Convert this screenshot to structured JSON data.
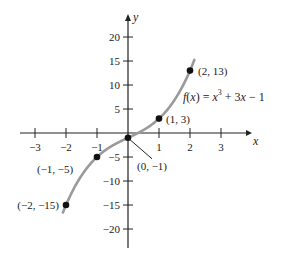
{
  "chart_data": {
    "type": "line",
    "title": "",
    "xlabel": "x",
    "ylabel": "y",
    "xlim": [
      -3.5,
      3.5
    ],
    "ylim": [
      -25,
      23
    ],
    "grid": false,
    "x_ticks": [
      -3,
      -2,
      -1,
      1,
      2,
      3
    ],
    "y_ticks": [
      20,
      15,
      10,
      5,
      -5,
      -10,
      -15,
      -20
    ],
    "function_label": "f(x) = x³ + 3x − 1",
    "series": [
      {
        "name": "f(x) = x^3 + 3x - 1",
        "color": "#9a9a9a",
        "x": [
          -2.1,
          -2,
          -1.5,
          -1,
          -0.5,
          0,
          0.5,
          1,
          1.5,
          2,
          2.15
        ],
        "y": [
          -16.56,
          -15,
          -8.875,
          -5,
          -2.625,
          -1,
          0.625,
          3,
          6.875,
          13,
          15.39
        ]
      }
    ],
    "points": [
      {
        "x": -2,
        "y": -15,
        "label": "(−2, −15)"
      },
      {
        "x": -1,
        "y": -5,
        "label": "(−1, −5)"
      },
      {
        "x": 0,
        "y": -1,
        "label": "(0, −1)"
      },
      {
        "x": 1,
        "y": 3,
        "label": "(1, 3)"
      },
      {
        "x": 2,
        "y": 13,
        "label": "(2, 13)"
      }
    ]
  }
}
